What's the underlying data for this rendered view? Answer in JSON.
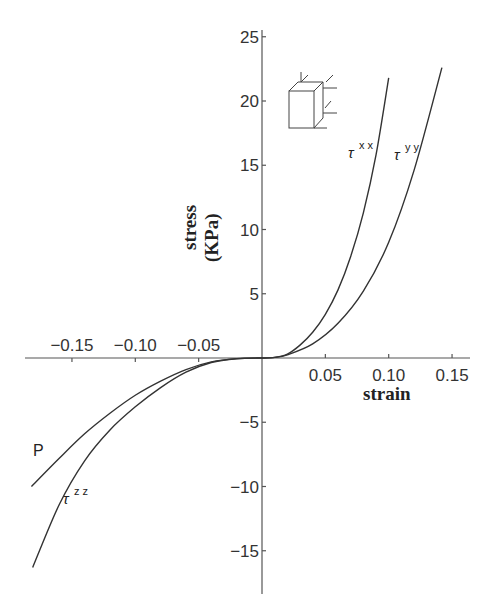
{
  "chart_data": {
    "type": "line",
    "title": "",
    "xlabel": "strain",
    "ylabel": "stress (KPa)",
    "xlim": [
      -0.19,
      0.16
    ],
    "ylim": [
      -16.5,
      25
    ],
    "grid": false,
    "x_ticks": [
      -0.15,
      -0.1,
      -0.05,
      0.05,
      0.1,
      0.15
    ],
    "x_tick_labels": [
      "−0.15",
      "−0.10",
      "−0.05",
      "0.05",
      "0.10",
      "0.15"
    ],
    "y_ticks": [
      25,
      20,
      15,
      10,
      5,
      -5,
      -10,
      -15
    ],
    "y_tick_labels": [
      "25",
      "20",
      "15",
      "10",
      "5",
      "−5",
      "−10",
      "−15"
    ],
    "series": [
      {
        "name": "τxx",
        "label": "τ",
        "superscript": "xx",
        "x": [
          0,
          0.01,
          0.02,
          0.03,
          0.04,
          0.05,
          0.06,
          0.07,
          0.08,
          0.09,
          0.1
        ],
        "y": [
          0,
          0.05,
          0.3,
          1.0,
          2.0,
          3.4,
          5.3,
          7.9,
          11.3,
          15.8,
          21.8
        ]
      },
      {
        "name": "τyy",
        "label": "τ",
        "superscript": "yy",
        "x": [
          0,
          0.01,
          0.02,
          0.04,
          0.06,
          0.08,
          0.1,
          0.12,
          0.142
        ],
        "y": [
          0,
          0.05,
          0.25,
          1.1,
          2.7,
          5.2,
          9.0,
          14.6,
          22.6
        ]
      },
      {
        "name": "P",
        "label": "P",
        "superscript": "",
        "x": [
          0,
          -0.02,
          -0.04,
          -0.06,
          -0.08,
          -0.1,
          -0.12,
          -0.14,
          -0.16,
          -0.182
        ],
        "y": [
          0,
          -0.05,
          -0.3,
          -0.9,
          -1.8,
          -2.9,
          -4.3,
          -5.9,
          -7.8,
          -10.0
        ]
      },
      {
        "name": "τzz",
        "label": "τ",
        "superscript": "zz",
        "x": [
          0,
          -0.02,
          -0.04,
          -0.06,
          -0.08,
          -0.1,
          -0.12,
          -0.14,
          -0.16,
          -0.181
        ],
        "y": [
          0,
          -0.06,
          -0.35,
          -1.1,
          -2.3,
          -3.8,
          -5.6,
          -8.0,
          -11.4,
          -16.3
        ]
      }
    ],
    "annotations": [
      "cube stress-direction inset diagram"
    ]
  },
  "labels": {
    "x_axis_title": "strain",
    "y_axis_title_line1": "stress",
    "y_axis_title_line2": "(KPa)",
    "tau_symbol": "τ",
    "sup_xx": "x x",
    "sup_yy": "y y",
    "sup_zz": "z z",
    "p_label": "P"
  }
}
